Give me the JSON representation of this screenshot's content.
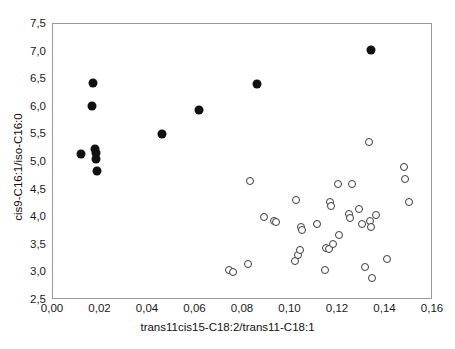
{
  "chart_data": {
    "type": "scatter",
    "title": "",
    "xlabel": "trans11cis15-C18:2/trans11-C18:1",
    "ylabel": "cis9-C16:1/iso-C16:0",
    "xlim": [
      0.0,
      0.16
    ],
    "ylim": [
      2.5,
      7.5
    ],
    "xticks": [
      "0,00",
      "0,02",
      "0,04",
      "0,06",
      "0,08",
      "0,10",
      "0,12",
      "0,14",
      "0,16"
    ],
    "xtick_values": [
      0.0,
      0.02,
      0.04,
      0.06,
      0.08,
      0.1,
      0.12,
      0.14,
      0.16
    ],
    "yticks": [
      "2,5",
      "3,0",
      "3,5",
      "4,0",
      "4,5",
      "5,0",
      "5,5",
      "6,0",
      "6,5",
      "7,0",
      "7,5"
    ],
    "ytick_values": [
      2.5,
      3.0,
      3.5,
      4.0,
      4.5,
      5.0,
      5.5,
      6.0,
      6.5,
      7.0,
      7.5
    ],
    "grid": false,
    "legend": "none",
    "decimal_separator": ",",
    "series": [
      {
        "name": "filled",
        "marker": "filled-circle",
        "color": "#111111",
        "points": [
          [
            0.0118,
            5.14
          ],
          [
            0.0167,
            6.44
          ],
          [
            0.0166,
            6.01
          ],
          [
            0.0176,
            5.24
          ],
          [
            0.018,
            5.16
          ],
          [
            0.0182,
            5.05
          ],
          [
            0.0184,
            4.83
          ],
          [
            0.0458,
            5.51
          ],
          [
            0.0615,
            5.95
          ],
          [
            0.086,
            6.42
          ],
          [
            0.1337,
            7.02
          ]
        ]
      },
      {
        "name": "open",
        "marker": "open-circle",
        "color": "#3a3a3a",
        "points": [
          [
            0.0742,
            3.05
          ],
          [
            0.0757,
            3.0
          ],
          [
            0.082,
            3.15
          ],
          [
            0.0828,
            4.65
          ],
          [
            0.0888,
            4.01
          ],
          [
            0.093,
            3.93
          ],
          [
            0.094,
            3.91
          ],
          [
            0.1022,
            4.32
          ],
          [
            0.1018,
            3.21
          ],
          [
            0.1032,
            3.31
          ],
          [
            0.1042,
            3.4
          ],
          [
            0.1046,
            3.82
          ],
          [
            0.105,
            3.77
          ],
          [
            0.111,
            3.87
          ],
          [
            0.1146,
            3.04
          ],
          [
            0.115,
            3.45
          ],
          [
            0.1162,
            3.42
          ],
          [
            0.1168,
            4.28
          ],
          [
            0.1172,
            4.2
          ],
          [
            0.118,
            3.52
          ],
          [
            0.12,
            4.6
          ],
          [
            0.1205,
            3.68
          ],
          [
            0.1248,
            4.05
          ],
          [
            0.1252,
            3.98
          ],
          [
            0.1258,
            4.6
          ],
          [
            0.129,
            4.15
          ],
          [
            0.13,
            3.88
          ],
          [
            0.1315,
            3.1
          ],
          [
            0.133,
            5.36
          ],
          [
            0.1335,
            3.93
          ],
          [
            0.134,
            3.83
          ],
          [
            0.1342,
            2.9
          ],
          [
            0.136,
            4.04
          ],
          [
            0.1408,
            3.24
          ],
          [
            0.1478,
            4.91
          ],
          [
            0.148,
            4.7
          ],
          [
            0.15,
            4.27
          ]
        ]
      }
    ]
  }
}
